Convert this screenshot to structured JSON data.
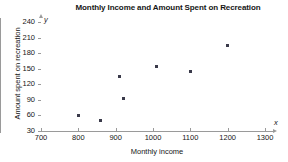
{
  "chart_data": {
    "type": "scatter",
    "title": "Monthly Income and Amount Spent on Recreation",
    "xlabel": "Monthly income",
    "ylabel": "Amount spent on recreation",
    "x_axis_variable": "x",
    "y_axis_variable": "y",
    "xlim": [
      700,
      1300
    ],
    "ylim": [
      30,
      240
    ],
    "xticks": [
      700,
      800,
      900,
      1000,
      1100,
      1200,
      1300
    ],
    "yticks": [
      30,
      60,
      90,
      120,
      150,
      180,
      210,
      240
    ],
    "grid": false,
    "legend": "none",
    "marker_color": "#3a3a4a",
    "axis_color": "#9a9a9a",
    "points": [
      {
        "x": 800,
        "y": 60
      },
      {
        "x": 860,
        "y": 50
      },
      {
        "x": 910,
        "y": 135
      },
      {
        "x": 920,
        "y": 92
      },
      {
        "x": 1010,
        "y": 155
      },
      {
        "x": 1100,
        "y": 145
      },
      {
        "x": 1200,
        "y": 195
      }
    ]
  }
}
